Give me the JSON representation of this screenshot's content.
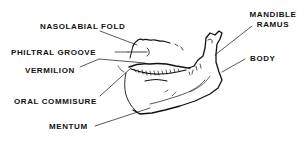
{
  "diagram": {
    "type": "anatomical-line-drawing",
    "colors": {
      "ink": "#111111",
      "background": "#ffffff"
    },
    "labels": [
      {
        "id": "nasolabial-fold",
        "text": "NASOLABIAL  FOLD"
      },
      {
        "id": "philtral-groove",
        "text": "PHILTRAL  GROOVE"
      },
      {
        "id": "vermilion",
        "text": "VERMILION"
      },
      {
        "id": "oral-commisure",
        "text": "ORAL  COMMISURE"
      },
      {
        "id": "mentum",
        "text": "MENTUM"
      },
      {
        "id": "mandible",
        "text": "MANDIBLE"
      },
      {
        "id": "ramus",
        "text": "RAMUS"
      },
      {
        "id": "body",
        "text": "BODY"
      }
    ]
  }
}
